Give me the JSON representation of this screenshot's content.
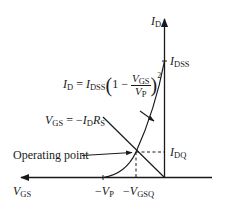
{
  "diagram": {
    "axes": {
      "y_axis": {
        "label": "I",
        "label_sub": "D"
      },
      "x_axis": {
        "label": "V",
        "label_sub": "GS"
      }
    },
    "ticks": {
      "idss": {
        "label": "I",
        "label_sub": "DSS"
      },
      "idq": {
        "label": "I",
        "label_sub": "DQ"
      },
      "vp": {
        "prefix": "−",
        "label": "V",
        "label_sub": "P"
      },
      "vgsq": {
        "prefix": "−",
        "label": "V",
        "label_sub": "GSQ"
      }
    },
    "transfer_equation": {
      "lhs": "I",
      "lhs_sub": "D",
      "eq": " = ",
      "coef": "I",
      "coef_sub": "DSS",
      "open_paren": "(",
      "one_minus": "1 − ",
      "num": "V",
      "num_sub": "GS",
      "den": "V",
      "den_sub": "P",
      "close_paren": ")",
      "power": "2"
    },
    "load_line_equation": {
      "lhs": "V",
      "lhs_sub": "GS",
      "eq": " = −",
      "i": "I",
      "i_sub": "D",
      "r": "R",
      "r_sub": "S"
    },
    "operating_point_label": "Operating point",
    "colors": {
      "ink": "#1a1a1a",
      "background": "#ffffff"
    }
  }
}
